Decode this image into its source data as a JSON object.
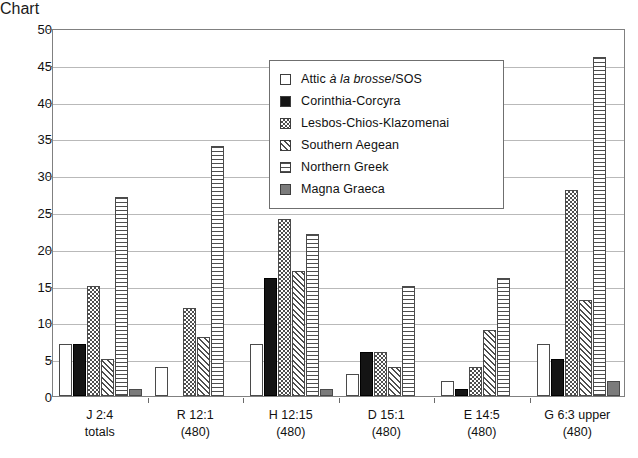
{
  "chart_data": {
    "type": "bar",
    "title": "",
    "subtitle": "",
    "xlabel": "",
    "ylabel": "",
    "ylim": [
      0,
      50
    ],
    "ytick_step": 5,
    "yticks": [
      0,
      5,
      10,
      15,
      20,
      25,
      30,
      35,
      40,
      45,
      50
    ],
    "grid": true,
    "grid_orientation": "horizontal",
    "legend_position": "inside-upper-center",
    "categories": [
      "J 2:4\ntotals",
      "R 12:1\n(480)",
      "H 12:15\n(480)",
      "D 15:1\n(480)",
      "E 14:5\n(480)",
      "G 6:3 upper\n(480)"
    ],
    "category_lines": [
      [
        "J 2:4",
        "totals"
      ],
      [
        "R 12:1",
        "(480)"
      ],
      [
        "H 12:15",
        "(480)"
      ],
      [
        "D 15:1",
        "(480)"
      ],
      [
        "E 14:5",
        "(480)"
      ],
      [
        "G 6:3 upper",
        "(480)"
      ]
    ],
    "series": [
      {
        "name": "Attic à la brosse/SOS",
        "name_pre_italic": "Attic ",
        "name_italic": "à la brosse",
        "name_post_italic": "/SOS",
        "pattern": "empty",
        "color": "#ffffff",
        "values": [
          7,
          4,
          7,
          3,
          2,
          7
        ]
      },
      {
        "name": "Corinthia-Corcyra",
        "pattern": "solid-black",
        "color": "#141414",
        "values": [
          7,
          0,
          16,
          6,
          1,
          5
        ]
      },
      {
        "name": "Lesbos-Chios-Klazomenai",
        "pattern": "checker",
        "color": "#4e4e4e",
        "values": [
          15,
          12,
          24,
          6,
          4,
          28
        ]
      },
      {
        "name": "Southern Aegean",
        "pattern": "diagonal",
        "color": "#4e4e4e",
        "values": [
          5,
          8,
          17,
          4,
          9,
          13
        ]
      },
      {
        "name": "Northern Greek",
        "pattern": "horizontal-lines",
        "color": "#4e4e4e",
        "values": [
          27,
          34,
          22,
          15,
          16,
          46
        ]
      },
      {
        "name": "Magna Graeca",
        "pattern": "solid-gray",
        "color": "#7b7b7b",
        "values": [
          1,
          0,
          1,
          0,
          0,
          2
        ]
      }
    ]
  }
}
